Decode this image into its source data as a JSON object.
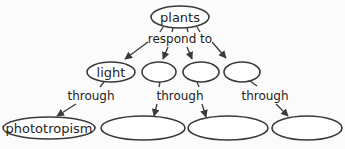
{
  "diagram": {
    "type": "concept-map",
    "colors": {
      "stroke": "#3a3a3a",
      "text": "#1e1e1e",
      "background": "#fbfbfb"
    },
    "root": {
      "label": "plants"
    },
    "root_link": "respond to",
    "stimuli": [
      {
        "label": "light"
      },
      {
        "label": ""
      },
      {
        "label": ""
      },
      {
        "label": ""
      }
    ],
    "through_links": [
      "through",
      "through",
      "through"
    ],
    "responses": [
      {
        "label": "phototropism"
      },
      {
        "label": ""
      },
      {
        "label": ""
      },
      {
        "label": ""
      }
    ]
  }
}
